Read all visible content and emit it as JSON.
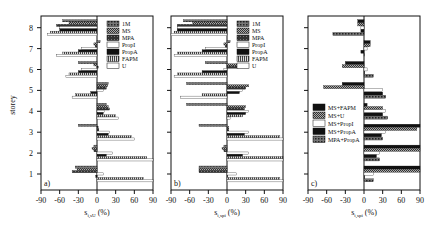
{
  "chart_data": [
    {
      "panel": "a)",
      "type": "bar",
      "orientation": "horizontal",
      "xlabel": "s_i,sU (%)",
      "ylabel": "storey",
      "xlim": [
        -90,
        90
      ],
      "xticks": [
        -90,
        -60,
        -30,
        0,
        30,
        60,
        90
      ],
      "categories": [
        1,
        2,
        3,
        4,
        5,
        6,
        7,
        8
      ],
      "legend_position": "upper right",
      "series": [
        {
          "name": "1M",
          "values": [
            -35,
            -5,
            -30,
            15,
            18,
            -30,
            5,
            -55
          ]
        },
        {
          "name": "MS",
          "values": [
            -32,
            -8,
            2,
            18,
            17,
            -5,
            -5,
            -45
          ]
        },
        {
          "name": "MPA",
          "values": [
            -40,
            -5,
            3,
            20,
            15,
            2,
            -3,
            -65
          ]
        },
        {
          "name": "PropI",
          "values": [
            10,
            25,
            20,
            12,
            10,
            -25,
            -25,
            -60
          ]
        },
        {
          "name": "PropA",
          "values": [
            -2,
            15,
            18,
            10,
            -10,
            -30,
            -30,
            -60
          ]
        },
        {
          "name": "FAPM",
          "values": [
            75,
            80,
            55,
            30,
            -35,
            -45,
            -55,
            -75
          ]
        },
        {
          "name": "U",
          "values": [
            90,
            90,
            60,
            35,
            -40,
            -50,
            -65,
            -80
          ]
        }
      ]
    },
    {
      "panel": "b)",
      "type": "bar",
      "orientation": "horizontal",
      "xlabel": "s_i,spi (%)",
      "ylabel": "storey",
      "xlim": [
        -90,
        90
      ],
      "xticks": [
        -90,
        -60,
        -30,
        0,
        30,
        60,
        90
      ],
      "categories": [
        1,
        2,
        3,
        4,
        5,
        6,
        7,
        8
      ],
      "legend_position": "upper right",
      "series": [
        {
          "name": "1M",
          "values": [
            -45,
            -5,
            -45,
            -65,
            -65,
            -35,
            5,
            -70
          ]
        },
        {
          "name": "MS",
          "values": [
            -45,
            -8,
            3,
            30,
            35,
            20,
            -5,
            -55
          ]
        },
        {
          "name": "MPA",
          "values": [
            -45,
            -5,
            3,
            28,
            30,
            18,
            -3,
            -80
          ]
        },
        {
          "name": "PropI",
          "values": [
            15,
            35,
            35,
            35,
            25,
            -5,
            -35,
            -80
          ]
        },
        {
          "name": "PropA",
          "values": [
            0,
            25,
            28,
            30,
            20,
            -40,
            -40,
            -80
          ]
        },
        {
          "name": "FAPM",
          "values": [
            85,
            90,
            85,
            25,
            -40,
            -80,
            -80,
            -85
          ]
        },
        {
          "name": "U",
          "values": [
            90,
            90,
            90,
            5,
            -75,
            -85,
            -85,
            -90
          ]
        }
      ]
    },
    {
      "panel": "c)",
      "type": "bar",
      "orientation": "horizontal",
      "xlabel": "s_i,spi (%)",
      "ylabel": "",
      "xlim": [
        -90,
        90
      ],
      "xticks": [
        -90,
        -60,
        -30,
        0,
        30,
        60,
        90
      ],
      "categories": [
        1,
        2,
        3,
        4,
        5,
        6,
        7,
        8
      ],
      "legend_position": "lower left",
      "series": [
        {
          "name": "MS+FAPM",
          "values": [
            90,
            90,
            90,
            5,
            -35,
            -30,
            10,
            -10
          ]
        },
        {
          "name": "MS+U",
          "values": [
            90,
            90,
            85,
            30,
            -65,
            -35,
            10,
            -10
          ]
        },
        {
          "name": "MS+PropI",
          "values": [
            15,
            25,
            35,
            35,
            30,
            5,
            5,
            -5
          ]
        },
        {
          "name": "MS+PropA",
          "values": [
            0,
            20,
            28,
            30,
            30,
            0,
            -5,
            -5
          ]
        },
        {
          "name": "MPA+PropA",
          "values": [
            15,
            25,
            30,
            38,
            35,
            15,
            0,
            -50
          ]
        }
      ]
    }
  ],
  "panels": [
    {
      "tag": "a)",
      "xlabel_main": "s",
      "xlabel_sub": "i,sU",
      "xlabel_unit": "(%)"
    },
    {
      "tag": "b)",
      "xlabel_main": "s",
      "xlabel_sub": "i,spi",
      "xlabel_unit": "(%)"
    },
    {
      "tag": "c)",
      "xlabel_main": "s",
      "xlabel_sub": "i,spi",
      "xlabel_unit": "(%)"
    }
  ],
  "ylabel": "storey"
}
